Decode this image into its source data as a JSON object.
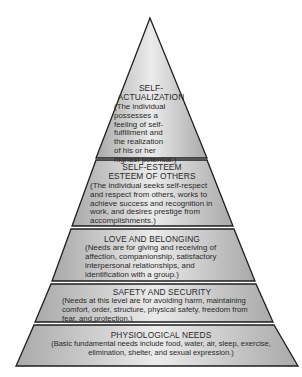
{
  "diagram": {
    "type": "hierarchy-pyramid",
    "colors": {
      "outline": "#1e1e1e",
      "fill_edge": "#a9a9a9",
      "fill_center": "#ebebeb",
      "text": "#2a2a2a"
    },
    "tiers": [
      {
        "level": 5,
        "title_line1": "SELF-",
        "title_line2": "ACTUALIZATION",
        "description_lines": [
          "(The individual",
          "possesses a",
          "feeling of self-",
          "fulfillment and",
          "the realization",
          "of his or her",
          "highest potential.)"
        ]
      },
      {
        "level": 4,
        "title_line1": "SELF-ESTEEM",
        "title_line2": "ESTEEM OF OTHERS",
        "description_lines": [
          "(The individual seeks self-respect",
          "and respect from others, works to",
          "achieve success and recognition in",
          "work, and desires prestige from",
          "accomplishments.)"
        ]
      },
      {
        "level": 3,
        "title": "LOVE AND BELONGING",
        "description_lines": [
          "(Needs are for giving and receiving of",
          "affection, companionship, satisfactory",
          "interpersonal relationships, and",
          "identification with a group.)"
        ]
      },
      {
        "level": 2,
        "title": "SAFETY AND SECURITY",
        "description_lines": [
          "(Needs at this level are for avoiding harm, maintaining",
          "comfort, order, structure, physical safety, freedom from",
          "fear, and protection.)"
        ]
      },
      {
        "level": 1,
        "title": "PHYSIOLOGICAL NEEDS",
        "description_lines": [
          "(Basic fundamental needs include food, water, air, sleep, exercise,",
          "elimination, shelter, and sexual expression.)"
        ]
      }
    ]
  }
}
